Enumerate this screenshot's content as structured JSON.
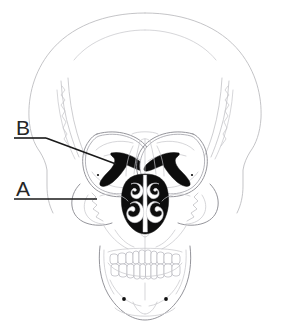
{
  "figure": {
    "title": "Anterior view of the human skull",
    "view": "anterior",
    "background_color": "#ffffff",
    "line_color": "#b9b9bd",
    "cavity_color": "#0d0d0d",
    "label_color": "#262626",
    "leader_color": "#1a1a1a",
    "width": 291,
    "height": 328
  },
  "labels": [
    {
      "id": "label-b",
      "text": "B",
      "x": 16,
      "y": 135,
      "underline": {
        "x1": 14,
        "y1": 138,
        "x2": 46,
        "y2": 138
      },
      "leader": {
        "x1": 46,
        "y1": 138,
        "x2": 116,
        "y2": 164
      },
      "points_to": "inferior-orbital-fissure"
    },
    {
      "id": "label-a",
      "text": "A",
      "x": 16,
      "y": 196,
      "underline": {
        "x1": 14,
        "y1": 199,
        "x2": 97,
        "y2": 199
      },
      "leader": null,
      "points_to": "maxilla-zygomatic-region"
    }
  ],
  "anatomy": {
    "regions": [
      "cranium",
      "frontal-bone",
      "temporal-line",
      "left-orbit",
      "right-orbit",
      "inferior-orbital-fissure-left",
      "inferior-orbital-fissure-right",
      "nasal-aperture",
      "nasal-concha",
      "vomer",
      "maxilla",
      "zygomatic-bone",
      "infraorbital-foramen-left",
      "infraorbital-foramen-right",
      "mental-foramen-left",
      "mental-foramen-right",
      "upper-teeth",
      "lower-teeth",
      "mandible",
      "mental-protuberance"
    ],
    "upper_teeth_count": 14,
    "lower_teeth_count": 14
  }
}
